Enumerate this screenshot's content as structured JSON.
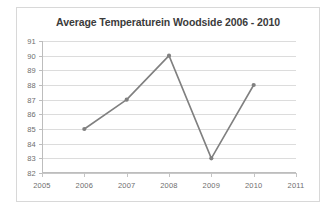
{
  "chart_data": {
    "type": "line",
    "title": "Average Temperaturein Woodside 2006 - 2010",
    "xlabel": "",
    "ylabel": "",
    "x": [
      2006,
      2007,
      2008,
      2009,
      2010
    ],
    "values": [
      85,
      87,
      90,
      83,
      88
    ],
    "series": [
      {
        "name": "Average Temperature",
        "x": [
          2006,
          2007,
          2008,
          2009,
          2010
        ],
        "values": [
          85,
          87,
          90,
          83,
          88
        ]
      }
    ],
    "xlim": [
      2005,
      2011
    ],
    "ylim": [
      82,
      91
    ],
    "x_tick_labels": [
      "2005",
      "2006",
      "2007",
      "2008",
      "2009",
      "2010",
      "2011"
    ],
    "x_ticks": [
      2005,
      2006,
      2007,
      2008,
      2009,
      2010,
      2011
    ],
    "y_tick_labels": [
      "91",
      "90",
      "89",
      "88",
      "87",
      "86",
      "85",
      "84",
      "83",
      "82"
    ],
    "y_ticks": [
      91,
      90,
      89,
      88,
      87,
      86,
      85,
      84,
      83,
      82
    ],
    "grid": true,
    "grid_axis": "y",
    "legend": false,
    "legend_position": "none",
    "line_color": "#808080",
    "marker_color": "#808080",
    "marker": "circle",
    "grid_color": "#dcdcdc",
    "axis_color": "#bdbdbd",
    "title_color": "#3b3b3b",
    "tick_label_color": "#6e6e6e",
    "background_color": "#ffffff",
    "border_color": "#d8d8d8"
  },
  "ghost_text": ""
}
